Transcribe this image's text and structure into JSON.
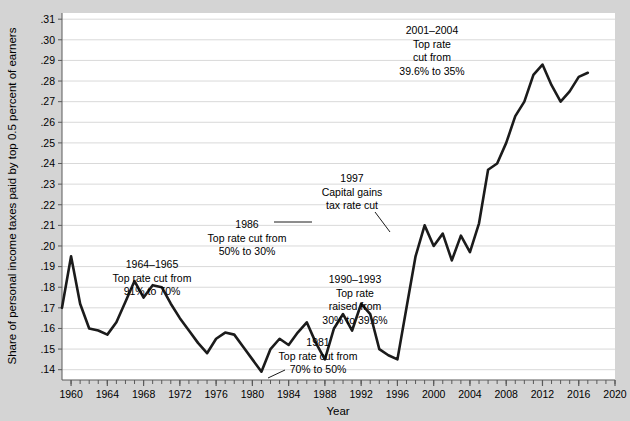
{
  "chart_data": {
    "type": "line",
    "title": "",
    "subtitle": "",
    "xlabel": "Year",
    "ylabel": "Share of personal income taxes paid by top 0.5 percent of earners",
    "xlim": [
      1959,
      2020
    ],
    "ylim": [
      0.135,
      0.313
    ],
    "grid": true,
    "legend": "none",
    "x_tick_labels": [
      "1960",
      "1964",
      "1968",
      "1972",
      "1976",
      "1980",
      "1984",
      "1988",
      "1992",
      "1996",
      "2000",
      "2004",
      "2008",
      "2012",
      "2016",
      "2020"
    ],
    "x_tick_values": [
      1960,
      1964,
      1968,
      1972,
      1976,
      1980,
      1984,
      1988,
      1992,
      1996,
      2000,
      2004,
      2008,
      2012,
      2016,
      2020
    ],
    "x_minor_tick_step": 1,
    "y_tick_labels": [
      ".14",
      ".15",
      ".16",
      ".17",
      ".18",
      ".19",
      ".20",
      ".21",
      ".22",
      ".23",
      ".24",
      ".25",
      ".26",
      ".27",
      ".28",
      ".29",
      ".30",
      ".31"
    ],
    "y_tick_values": [
      0.14,
      0.15,
      0.16,
      0.17,
      0.18,
      0.19,
      0.2,
      0.21,
      0.22,
      0.23,
      0.24,
      0.25,
      0.26,
      0.27,
      0.28,
      0.29,
      0.3,
      0.31
    ],
    "line_color": "#1b1b1b",
    "line_width": 2.6,
    "x": [
      1959,
      1960,
      1961,
      1962,
      1963,
      1964,
      1965,
      1966,
      1967,
      1968,
      1969,
      1970,
      1971,
      1972,
      1973,
      1974,
      1975,
      1976,
      1977,
      1978,
      1979,
      1980,
      1981,
      1982,
      1983,
      1984,
      1985,
      1986,
      1987,
      1988,
      1989,
      1990,
      1991,
      1992,
      1993,
      1994,
      1995,
      1996,
      1997,
      1998,
      1999,
      2000,
      2001,
      2002,
      2003,
      2004,
      2005,
      2006,
      2007,
      2008,
      2009,
      2010,
      2011,
      2012,
      2013,
      2014,
      2015,
      2016,
      2017
    ],
    "series": [
      {
        "name": "Share of personal income taxes paid by top 0.5 percent of earners",
        "values": [
          0.17,
          0.195,
          0.172,
          0.16,
          0.159,
          0.157,
          0.163,
          0.173,
          0.183,
          0.175,
          0.181,
          0.18,
          0.172,
          0.165,
          0.159,
          0.153,
          0.148,
          0.155,
          0.158,
          0.157,
          0.151,
          0.145,
          0.139,
          0.15,
          0.155,
          0.152,
          0.158,
          0.163,
          0.153,
          0.145,
          0.16,
          0.167,
          0.159,
          0.172,
          0.167,
          0.15,
          0.147,
          0.145,
          0.17,
          0.195,
          0.21,
          0.2,
          0.206,
          0.193,
          0.205,
          0.197,
          0.211,
          0.237,
          0.24,
          0.25,
          0.263,
          0.27,
          0.283,
          0.288,
          0.278,
          0.27,
          0.275,
          0.282,
          0.284
        ]
      }
    ],
    "series_pixel_path": [
      [
        67,
        368
      ],
      [
        76,
        244
      ],
      [
        85,
        296
      ],
      [
        94,
        311
      ],
      [
        103,
        313
      ],
      [
        112,
        316
      ],
      [
        121,
        307
      ],
      [
        130,
        281
      ],
      [
        139,
        254
      ],
      [
        148,
        271
      ],
      [
        157,
        259
      ],
      [
        166,
        262
      ],
      [
        175,
        280
      ],
      [
        184,
        295
      ],
      [
        193,
        311
      ],
      [
        202,
        323
      ],
      [
        211,
        335
      ],
      [
        220,
        320
      ],
      [
        229,
        313
      ],
      [
        238,
        316
      ],
      [
        247,
        328
      ],
      [
        256,
        340
      ],
      [
        265,
        349
      ],
      [
        274,
        329
      ],
      [
        283,
        319
      ],
      [
        292,
        325
      ],
      [
        301,
        313
      ],
      [
        310,
        303
      ],
      [
        319,
        324
      ],
      [
        328,
        341
      ],
      [
        337,
        310
      ],
      [
        346,
        295
      ],
      [
        355,
        312
      ],
      [
        364,
        283
      ],
      [
        373,
        294
      ],
      [
        382,
        313
      ],
      [
        391,
        318
      ],
      [
        400,
        320
      ],
      [
        409,
        268
      ],
      [
        418,
        197
      ],
      [
        427,
        140
      ],
      [
        436,
        160
      ],
      [
        445,
        148
      ],
      [
        454,
        187
      ],
      [
        463,
        148
      ],
      [
        472,
        167
      ],
      [
        481,
        135
      ],
      [
        490,
        82
      ],
      [
        499,
        75
      ],
      [
        508,
        60
      ],
      [
        517,
        162
      ],
      [
        526,
        176
      ],
      [
        535,
        128
      ],
      [
        544,
        120
      ],
      [
        553,
        155
      ],
      [
        562,
        165
      ],
      [
        571,
        112
      ],
      [
        580,
        103
      ],
      [
        589,
        78
      ]
    ],
    "annotations": [
      {
        "id": "annot-1964-1965",
        "lines": [
          "1964–1965",
          "Top rate cut from",
          "91% to 70%"
        ],
        "x": 152,
        "y": 268,
        "align": "center",
        "leader": null
      },
      {
        "id": "annot-1986",
        "lines": [
          "1986",
          "Top rate cut from",
          "50% to 30%"
        ],
        "x": 247,
        "y": 228,
        "align": "center",
        "leader": {
          "x1": 274,
          "y1": 222,
          "x2": 312,
          "y2": 222
        }
      },
      {
        "id": "annot-1981",
        "lines": [
          "1981",
          "Top rate cut from",
          "70% to 50%"
        ],
        "x": 318,
        "y": 346,
        "align": "center",
        "leader": {
          "x1": 285,
          "y1": 370,
          "x2": 268,
          "y2": 378
        }
      },
      {
        "id": "annot-1990-1993",
        "lines": [
          "1990–1993",
          "Top rate",
          "raised from",
          "30% to 39.6%"
        ],
        "x": 355,
        "y": 283,
        "align": "center",
        "leader": null
      },
      {
        "id": "annot-1997",
        "lines": [
          "1997",
          "Capital gains",
          "tax rate cut"
        ],
        "x": 352,
        "y": 182,
        "align": "center",
        "leader": {
          "x1": 375,
          "y1": 212,
          "x2": 390,
          "y2": 232
        }
      },
      {
        "id": "annot-2001-2004",
        "lines": [
          "2001–2004",
          "Top rate",
          "cut from",
          "39.6% to 35%"
        ],
        "x": 432,
        "y": 34,
        "align": "center",
        "leader": null
      }
    ]
  },
  "figure": {
    "background_color": "#d4d4d4",
    "plot_background_color": "#ffffff",
    "gridline_color": "#d9d9d9",
    "axis_color": "#5a5a5a",
    "text_color": "#000000"
  }
}
